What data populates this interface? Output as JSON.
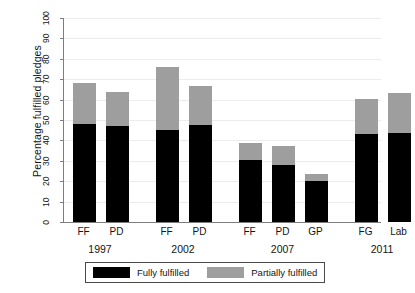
{
  "chart_data": {
    "type": "bar",
    "subtype": "stacked-bar-grouped",
    "title": "",
    "xlabel": "",
    "ylabel": "Percentage fulfilled pledges",
    "ylim": [
      0,
      100
    ],
    "yticks": [
      0,
      10,
      20,
      30,
      40,
      50,
      60,
      70,
      80,
      90,
      100
    ],
    "ytick_labels": [
      "0",
      "10",
      "20",
      "30",
      "40",
      "50",
      "60",
      "70",
      "80",
      "90",
      "100"
    ],
    "grid": true,
    "grid_axis": "y",
    "legend_position": "bottom",
    "categories": [
      "FF",
      "PD",
      "FF",
      "PD",
      "FF",
      "PD",
      "GP",
      "FG",
      "Lab"
    ],
    "groups": [
      {
        "label": "1997",
        "categories": [
          "FF",
          "PD"
        ]
      },
      {
        "label": "2002",
        "categories": [
          "FF",
          "PD"
        ]
      },
      {
        "label": "2007",
        "categories": [
          "FF",
          "PD",
          "GP"
        ]
      },
      {
        "label": "2011",
        "categories": [
          "FG",
          "Lab"
        ]
      }
    ],
    "series": [
      {
        "name": "Fully fulfilled",
        "color": "#000000",
        "values": [
          48,
          47,
          45,
          47.5,
          30.5,
          28,
          20,
          43,
          43.5
        ]
      },
      {
        "name": "Partially fulfilled",
        "color": "#9e9e9e",
        "values": [
          20,
          16.5,
          31,
          19,
          8,
          9.5,
          3.5,
          17.5,
          19.5
        ]
      }
    ],
    "totals": [
      68,
      63.5,
      76,
      66.5,
      38.5,
      37.5,
      23.5,
      60.5,
      63
    ],
    "bars": [
      {
        "group": "1997",
        "category": "FF",
        "fully_fulfilled": 48,
        "partially_fulfilled": 20,
        "total": 68
      },
      {
        "group": "1997",
        "category": "PD",
        "fully_fulfilled": 47,
        "partially_fulfilled": 16.5,
        "total": 63.5
      },
      {
        "group": "2002",
        "category": "FF",
        "fully_fulfilled": 45,
        "partially_fulfilled": 31,
        "total": 76
      },
      {
        "group": "2002",
        "category": "PD",
        "fully_fulfilled": 47.5,
        "partially_fulfilled": 19,
        "total": 66.5
      },
      {
        "group": "2007",
        "category": "FF",
        "fully_fulfilled": 30.5,
        "partially_fulfilled": 8,
        "total": 38.5
      },
      {
        "group": "2007",
        "category": "PD",
        "fully_fulfilled": 28,
        "partially_fulfilled": 9.5,
        "total": 37.5
      },
      {
        "group": "2007",
        "category": "GP",
        "fully_fulfilled": 20,
        "partially_fulfilled": 3.5,
        "total": 23.5
      },
      {
        "group": "2011",
        "category": "FG",
        "fully_fulfilled": 43,
        "partially_fulfilled": 17.5,
        "total": 60.5
      },
      {
        "group": "2011",
        "category": "Lab",
        "fully_fulfilled": 43.5,
        "partially_fulfilled": 19.5,
        "total": 63
      }
    ],
    "legend": [
      {
        "label": "Fully fulfilled",
        "color": "#000000"
      },
      {
        "label": "Partially fulfilled",
        "color": "#9e9e9e"
      }
    ]
  },
  "colors": {
    "fully_fulfilled": "#000000",
    "partially_fulfilled": "#9e9e9e",
    "axis": "#7d7d7d",
    "grid": "#ececec",
    "background": "#ffffff",
    "text": "#141414"
  }
}
